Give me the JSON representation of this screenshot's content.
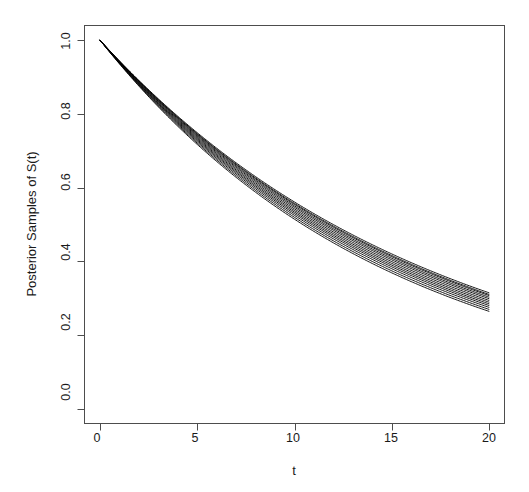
{
  "chart_data": {
    "type": "line",
    "title": "",
    "subtitle": "",
    "xlabel": "t",
    "ylabel": "Posterior Samples of S(t)",
    "xlim": [
      0,
      20
    ],
    "ylim": [
      0.0,
      1.0
    ],
    "xticks": [
      0,
      5,
      10,
      15,
      20
    ],
    "xtick_labels": [
      "0",
      "5",
      "10",
      "15",
      "20"
    ],
    "yticks": [
      0.0,
      0.2,
      0.4,
      0.6,
      0.8,
      1.0
    ],
    "ytick_labels": [
      "0.0",
      "0.2",
      "0.4",
      "0.6",
      "0.8",
      "1.0"
    ],
    "grid": false,
    "legend": false,
    "legend_position": "none",
    "box": true,
    "line_color": "#000000",
    "line_width": 0.9,
    "background_color": "#ffffff",
    "axis_color": "#4d4d4d",
    "x": [
      0,
      1,
      2,
      3,
      4,
      5,
      6,
      7,
      8,
      9,
      10,
      11,
      12,
      13,
      14,
      15,
      16,
      17,
      18,
      19,
      20
    ],
    "series": [
      {
        "name": "draw-01",
        "lambda": 0.0665,
        "values": [
          1.0,
          0.9357,
          0.8755,
          0.8192,
          0.7665,
          0.7172,
          0.6711,
          0.6279,
          0.5875,
          0.5497,
          0.5143,
          0.4812,
          0.4503,
          0.4213,
          0.3942,
          0.3689,
          0.3452,
          0.323,
          0.3022,
          0.2828,
          0.2646
        ]
      },
      {
        "name": "draw-02",
        "lambda": 0.0655,
        "values": [
          1.0,
          0.9366,
          0.8772,
          0.8216,
          0.7695,
          0.7207,
          0.675,
          0.6322,
          0.5921,
          0.5545,
          0.5194,
          0.4864,
          0.4556,
          0.4267,
          0.3996,
          0.3743,
          0.3505,
          0.3283,
          0.3074,
          0.2879,
          0.2697
        ]
      },
      {
        "name": "draw-03",
        "lambda": 0.0645,
        "values": [
          1.0,
          0.9375,
          0.8789,
          0.824,
          0.7725,
          0.7242,
          0.6789,
          0.6365,
          0.5967,
          0.5594,
          0.5245,
          0.4916,
          0.4609,
          0.4321,
          0.4051,
          0.3798,
          0.3561,
          0.3339,
          0.313,
          0.2934,
          0.2751
        ]
      },
      {
        "name": "draw-04",
        "lambda": 0.0636,
        "values": [
          1.0,
          0.9384,
          0.8805,
          0.8262,
          0.7752,
          0.7274,
          0.6825,
          0.6404,
          0.6009,
          0.5639,
          0.5291,
          0.4965,
          0.4659,
          0.4371,
          0.4102,
          0.3849,
          0.3612,
          0.3389,
          0.318,
          0.2984,
          0.28
        ]
      },
      {
        "name": "draw-05",
        "lambda": 0.0628,
        "values": [
          1.0,
          0.9391,
          0.8819,
          0.8282,
          0.7777,
          0.7303,
          0.6858,
          0.644,
          0.6047,
          0.5679,
          0.5333,
          0.5008,
          0.4702,
          0.4415,
          0.4146,
          0.3893,
          0.3656,
          0.3433,
          0.3224,
          0.3027,
          0.2843
        ]
      },
      {
        "name": "draw-06",
        "lambda": 0.062,
        "values": [
          1.0,
          0.9399,
          0.8834,
          0.8303,
          0.7803,
          0.7334,
          0.6893,
          0.6478,
          0.6088,
          0.5721,
          0.5377,
          0.5053,
          0.4749,
          0.4463,
          0.4194,
          0.3941,
          0.3704,
          0.3481,
          0.3271,
          0.3074,
          0.289
        ]
      },
      {
        "name": "draw-07",
        "lambda": 0.0612,
        "values": [
          1.0,
          0.9406,
          0.8848,
          0.8323,
          0.7829,
          0.7365,
          0.6928,
          0.6517,
          0.613,
          0.5766,
          0.5424,
          0.5101,
          0.4798,
          0.4513,
          0.4245,
          0.3992,
          0.3755,
          0.3532,
          0.3322,
          0.3125,
          0.2939
        ]
      },
      {
        "name": "draw-08",
        "lambda": 0.0604,
        "values": [
          1.0,
          0.9414,
          0.8863,
          0.8344,
          0.7855,
          0.7394,
          0.6961,
          0.6553,
          0.6169,
          0.5807,
          0.5467,
          0.5146,
          0.4844,
          0.456,
          0.4292,
          0.404,
          0.3803,
          0.358,
          0.337,
          0.3173,
          0.2987
        ]
      },
      {
        "name": "draw-09",
        "lambda": 0.0597,
        "values": [
          1.0,
          0.942,
          0.8875,
          0.8362,
          0.7877,
          0.7421,
          0.6991,
          0.6586,
          0.6204,
          0.5845,
          0.5506,
          0.5187,
          0.4886,
          0.4603,
          0.4336,
          0.4085,
          0.3848,
          0.3625,
          0.3415,
          0.3217,
          0.303
        ]
      },
      {
        "name": "draw-10",
        "lambda": 0.059,
        "values": [
          1.0,
          0.9427,
          0.8888,
          0.8379,
          0.7899,
          0.7447,
          0.702,
          0.6618,
          0.6239,
          0.5882,
          0.5545,
          0.5227,
          0.4928,
          0.4646,
          0.4379,
          0.4128,
          0.3892,
          0.3669,
          0.3459,
          0.326,
          0.3073
        ]
      },
      {
        "name": "draw-11",
        "lambda": 0.0585,
        "values": [
          1.0,
          0.9432,
          0.8896,
          0.839,
          0.7913,
          0.7463,
          0.7038,
          0.6637,
          0.6259,
          0.5903,
          0.5566,
          0.5249,
          0.4949,
          0.4667,
          0.4401,
          0.415,
          0.3914,
          0.3691,
          0.3481,
          0.3283,
          0.3096
        ]
      },
      {
        "name": "draw-12",
        "lambda": 0.0578,
        "values": [
          1.0,
          0.9438,
          0.8908,
          0.8406,
          0.7933,
          0.7487,
          0.7065,
          0.6667,
          0.6292,
          0.5938,
          0.5603,
          0.5287,
          0.4989,
          0.4708,
          0.4443,
          0.4193,
          0.3957,
          0.3734,
          0.3524,
          0.3326,
          0.3139
        ]
      }
    ]
  },
  "axes": {
    "x_title": "t",
    "y_title": "Posterior Samples of S(t)"
  }
}
